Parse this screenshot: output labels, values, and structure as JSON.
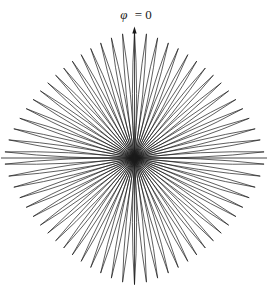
{
  "figure": {
    "label": {
      "symbol": "φ",
      "rest": "= 0"
    }
  },
  "colors": {
    "stroke": "#1a1a1a",
    "background": "#ffffff"
  },
  "chart_data": {
    "type": "line",
    "subtype": "polar-radiation-pattern",
    "title": "",
    "annotation_label": "φ = 0",
    "annotation_position": "top-center, above vertical axis arrow",
    "num_lobes": 66,
    "lobe_angular_spacing_deg": 5.4545,
    "lobe_axis_angles_deg_clockwise_from_phi0": [
      0.0,
      5.5,
      10.9,
      16.4,
      21.8,
      27.3,
      32.7,
      38.2,
      43.6,
      49.1,
      54.5,
      60.0,
      65.5,
      70.9,
      76.4,
      81.8,
      87.3,
      92.7,
      98.2,
      103.6,
      109.1,
      114.5,
      120.0,
      125.5,
      130.9,
      136.4,
      141.8,
      147.3,
      152.7,
      158.2,
      163.6,
      169.1,
      174.5,
      180.0,
      185.5,
      190.9,
      196.4,
      201.8,
      207.3,
      212.7,
      218.2,
      223.6,
      229.1,
      234.5,
      240.0,
      245.5,
      250.9,
      256.4,
      261.8,
      267.3,
      272.7,
      278.2,
      283.6,
      289.1,
      294.5,
      300.0,
      305.5,
      310.9,
      316.4,
      321.8,
      327.3,
      332.7,
      338.2,
      343.6,
      349.1,
      354.5
    ],
    "max_lobe_direction_deg": 0,
    "null_directions_deg": [
      90,
      270
    ],
    "center_px": {
      "x": 134.5,
      "y": 158
    },
    "tip_radius_envelope": {
      "shape": "superellipse",
      "radius_horizontal_px": 130.5,
      "radius_vertical_px": 126.5,
      "radius_diagonal_px": 115,
      "exponent": 1.5
    },
    "lobe_style": {
      "max_width_fraction_of_radius": 0.033,
      "stroke_width_px": 0.7,
      "fill": "none"
    },
    "axes": {
      "vertical_axis": {
        "x": 134.5,
        "y_top": 31,
        "y_bottom": 284.5,
        "arrowhead": "up, at top, under label"
      },
      "horizontal_axis": {
        "y": 158,
        "x_left": 1,
        "x_right": 267
      }
    }
  }
}
